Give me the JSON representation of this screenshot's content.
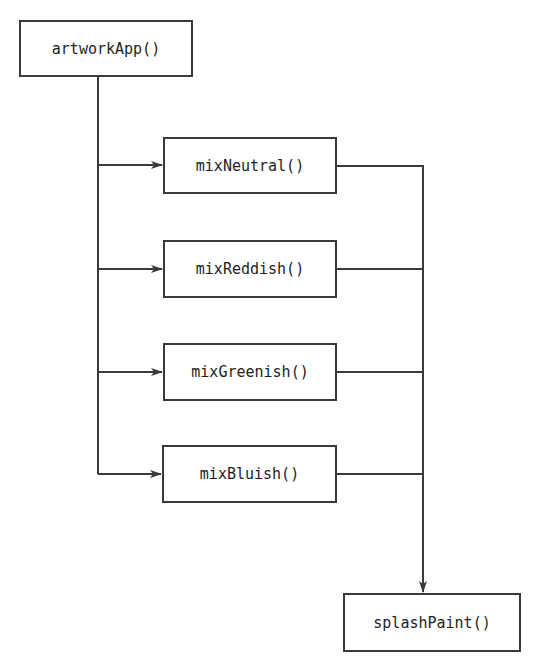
{
  "diagram": {
    "type": "call-flow",
    "colors": {
      "stroke": "#3a3a3a",
      "text": "#1e1e1e",
      "background": "#ffffff"
    },
    "nodes": {
      "root": {
        "label": "artworkApp()"
      },
      "mix_neutral": {
        "label": "mixNeutral()"
      },
      "mix_reddish": {
        "label": "mixReddish()"
      },
      "mix_greenish": {
        "label": "mixGreenish()"
      },
      "mix_bluish": {
        "label": "mixBluish()"
      },
      "sink": {
        "label": "splashPaint()"
      }
    },
    "edges": [
      {
        "from": "artworkApp()",
        "to": "mixNeutral()"
      },
      {
        "from": "artworkApp()",
        "to": "mixReddish()"
      },
      {
        "from": "artworkApp()",
        "to": "mixGreenish()"
      },
      {
        "from": "artworkApp()",
        "to": "mixBluish()"
      },
      {
        "from": "mixNeutral()",
        "to": "splashPaint()"
      },
      {
        "from": "mixReddish()",
        "to": "splashPaint()"
      },
      {
        "from": "mixGreenish()",
        "to": "splashPaint()"
      },
      {
        "from": "mixBluish()",
        "to": "splashPaint()"
      }
    ]
  }
}
